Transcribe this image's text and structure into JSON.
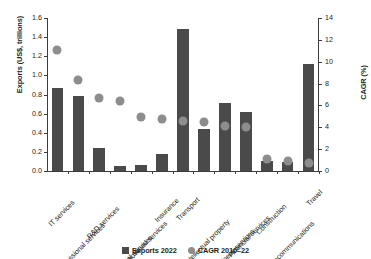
{
  "chart_data": {
    "type": "bar",
    "title": "",
    "subtitle": "",
    "xlabel": "",
    "ylabel": "Exports (US$, trillions)",
    "y2label": "CAGR (%)",
    "ylim": [
      0,
      1.6
    ],
    "y2lim": [
      0,
      14
    ],
    "yticks": [
      "0.0",
      "0.2",
      "0.4",
      "0.6",
      "0.8",
      "1.0",
      "1.2",
      "1.4",
      "1.6"
    ],
    "ytick_values": [
      0.0,
      0.2,
      0.4,
      0.6,
      0.8,
      1.0,
      1.2,
      1.4,
      1.6
    ],
    "y2ticks": [
      "0",
      "2",
      "4",
      "6",
      "8",
      "10",
      "12",
      "14"
    ],
    "y2tick_values": [
      0,
      2,
      4,
      6,
      8,
      10,
      12,
      14
    ],
    "grid": false,
    "legend_position": "bottom-center",
    "categories": [
      "IT services",
      "Professional services",
      "R&D services",
      "Other recreational services",
      "Audiovisual services",
      "Insurance",
      "Transport",
      "Intellectual property",
      "Other business services",
      "Financial services",
      "Construction",
      "Telecommunications",
      "Travel"
    ],
    "series": [
      {
        "name": "Exports 2022",
        "type": "bar",
        "axis": "left",
        "unit": "US$ trillions",
        "color": "#4a4a4a",
        "values": [
          0.87,
          0.78,
          0.24,
          0.05,
          0.06,
          0.18,
          1.48,
          0.44,
          0.71,
          0.62,
          0.1,
          0.09,
          1.12
        ]
      },
      {
        "name": "CAGR 2010–22",
        "type": "scatter",
        "axis": "right",
        "unit": "%",
        "color": "#8d8d8d",
        "values": [
          11.5,
          8.7,
          7.1,
          6.8,
          5.4,
          5.2,
          5.0,
          4.9,
          4.5,
          4.4,
          1.5,
          1.3,
          1.1
        ]
      }
    ]
  },
  "legend": {
    "items": [
      {
        "label": "Exports 2022",
        "marker": "square-swatch"
      },
      {
        "label": "CAGR 2010–22",
        "marker": "circle-swatch"
      }
    ]
  }
}
